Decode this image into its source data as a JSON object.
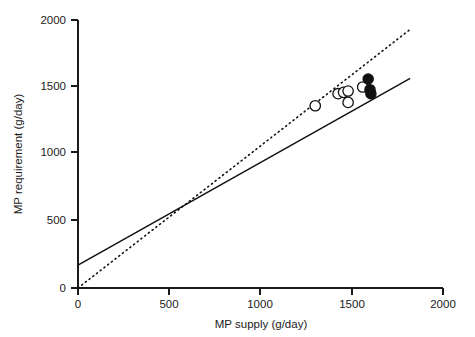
{
  "chart_data": {
    "type": "scatter",
    "title": "",
    "xlabel": "MP supply (g/day)",
    "ylabel": "MP requirement (g/day)",
    "xlim": [
      0,
      2000
    ],
    "ylim": [
      0,
      2000
    ],
    "xticks": [
      0,
      500,
      1000,
      1500,
      2000
    ],
    "yticks": [
      0,
      500,
      1000,
      1500,
      2000
    ],
    "xtick_labels": [
      "0",
      "500",
      "1000",
      "1500",
      "2000"
    ],
    "ytick_labels": [
      "0",
      "500",
      "1000",
      "1500",
      "2000"
    ],
    "grid": false,
    "legend": false,
    "series": [
      {
        "name": "open-circles",
        "marker": "open circle",
        "points": [
          {
            "x": 1300,
            "y": 1360
          },
          {
            "x": 1425,
            "y": 1450
          },
          {
            "x": 1455,
            "y": 1460
          },
          {
            "x": 1480,
            "y": 1470
          },
          {
            "x": 1480,
            "y": 1385
          },
          {
            "x": 1560,
            "y": 1500
          }
        ]
      },
      {
        "name": "filled-circles",
        "marker": "filled circle",
        "points": [
          {
            "x": 1590,
            "y": 1560
          },
          {
            "x": 1600,
            "y": 1480
          },
          {
            "x": 1605,
            "y": 1450
          }
        ]
      }
    ],
    "lines": [
      {
        "name": "regression-line",
        "style": "solid",
        "intercept": 170,
        "slope": 0.765,
        "x_start": 0,
        "x_end": 1820,
        "y_start": 170,
        "y_end": 1565
      },
      {
        "name": "identity-line",
        "style": "dotted",
        "intercept": 0,
        "slope": 1.06,
        "x_start": 0,
        "x_end": 1820,
        "y_start": 0,
        "y_end": 1930
      }
    ],
    "colors": {
      "axis": "#1a1a1a",
      "solid_line": "#111111",
      "dotted_line": "#111111",
      "open_marker_fill": "#ffffff",
      "filled_marker_fill": "#111111",
      "background": "#ffffff"
    }
  }
}
